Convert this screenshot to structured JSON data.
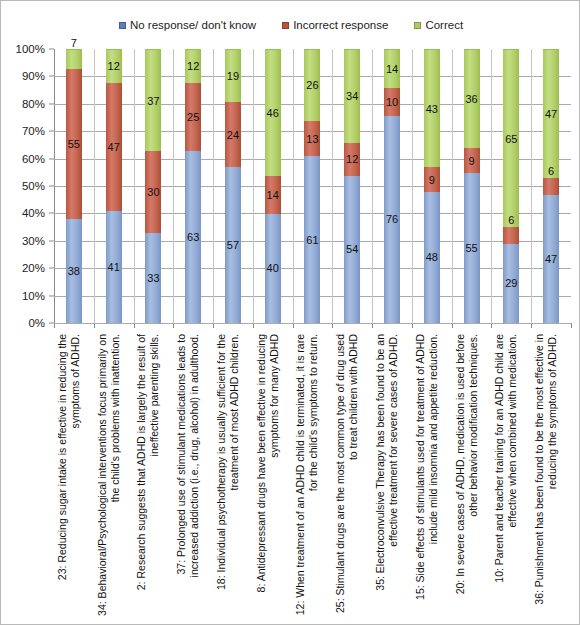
{
  "chart_data": {
    "type": "bar",
    "subtype": "stacked-percentage-column",
    "title": "",
    "xlabel": "",
    "ylabel": "",
    "ylim": [
      0,
      100
    ],
    "ytick_labels": [
      "100%",
      "90%",
      "80%",
      "70%",
      "60%",
      "50%",
      "40%",
      "30%",
      "20%",
      "10%",
      "0%"
    ],
    "ytick_values": [
      100,
      90,
      80,
      70,
      60,
      50,
      40,
      30,
      20,
      10,
      0
    ],
    "grid": true,
    "legend_position": "top-center",
    "stack_order_bottom_to_top": [
      "No response/ don't know",
      "Incorrect response",
      "Correct"
    ],
    "categories": [
      "23: Reducing sugar intake is effective in reducing the symptoms of ADHD.",
      "34: Behavioral/Psychological interventions focus primarily on the child's problems with inattention.",
      "2: Research suggests that ADHD is largely the result of ineffective parenting skills.",
      "37: Prolonged use of stimulant medications leads to increased addiction (i.e., drug, alcohol) in adulthood.",
      "18: Individual psychotherapy is usually sufficient for the treatment of most ADHD children.",
      "8: Antidepressant drugs have been effective in reducing symptoms for many ADHD",
      "12: When treatment of an ADHD child is terminated, it is rare for the child's symptoms to return.",
      "25: Stimulant drugs are the most common type of drug used to treat children with ADHD",
      "35: Electroconvulsive Therapy has been found to be an effective treatment for severe cases of ADHD.",
      "15: Side effects of stimulants used for treatment of ADHD include mild insomnia and appetite reduction.",
      "20: In severe cases of ADHD, medication is used before other behavior modification techniques.",
      "10: Parent and teacher training for an ADHD child are effective when combined with medication.",
      "36: Punishment has been found to be the most effective in reducing the symptoms of ADHD."
    ],
    "series": [
      {
        "name": "No response/ don't know",
        "color": "#93abd6",
        "values": [
          38,
          41,
          33,
          63,
          57,
          40,
          61,
          54,
          76,
          48,
          55,
          29,
          47
        ]
      },
      {
        "name": "Incorrect response",
        "color": "#c4664f",
        "values": [
          55,
          47,
          30,
          25,
          24,
          14,
          13,
          12,
          10,
          9,
          9,
          6,
          6
        ]
      },
      {
        "name": "Correct",
        "color": "#b3d06a",
        "values": [
          7,
          12,
          37,
          12,
          19,
          46,
          26,
          34,
          14,
          43,
          36,
          65,
          47
        ]
      }
    ]
  },
  "legend": {
    "entries": [
      {
        "label": "No response/ don't know",
        "color": "#5b7ec0"
      },
      {
        "label": "Incorrect response",
        "color": "#b8553d"
      },
      {
        "label": "Correct",
        "color": "#aecb63"
      }
    ]
  }
}
